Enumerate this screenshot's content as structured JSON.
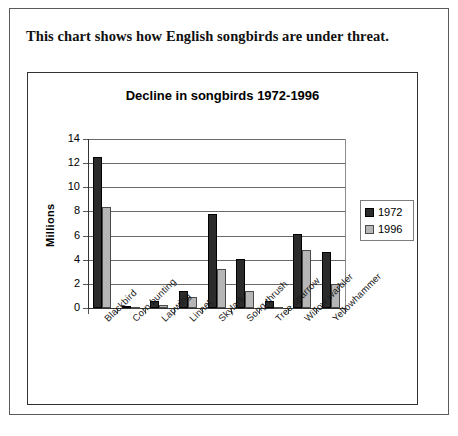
{
  "caption": "This chart shows how English songbirds are under threat.",
  "legend": {
    "entries": [
      {
        "label": "1972",
        "color": "#2b2b2b"
      },
      {
        "label": "1996",
        "color": "#b6b6b6"
      }
    ]
  },
  "chart_data": {
    "type": "bar",
    "title": "Decline in songbirds 1972-1996",
    "xlabel": "",
    "ylabel": "Millions",
    "ylim": [
      0,
      14
    ],
    "yticks": [
      0,
      2,
      4,
      6,
      8,
      10,
      12,
      14
    ],
    "grid": true,
    "legend_position": "right",
    "categories": [
      "Blackbird",
      "Corn bunting",
      "Lapwing",
      "Linnet",
      "Skylark",
      "Song thrush",
      "Tree sparrow",
      "Willow warbler",
      "Yellowhammer"
    ],
    "series": [
      {
        "name": "1972",
        "color": "#2b2b2b",
        "values": [
          12.5,
          0.15,
          0.6,
          1.4,
          7.8,
          4.1,
          0.6,
          6.1,
          4.6
        ]
      },
      {
        "name": "1996",
        "color": "#b6b6b6",
        "values": [
          8.4,
          0.02,
          0.25,
          0.9,
          3.2,
          1.4,
          0.08,
          4.8,
          2.0
        ]
      }
    ]
  }
}
